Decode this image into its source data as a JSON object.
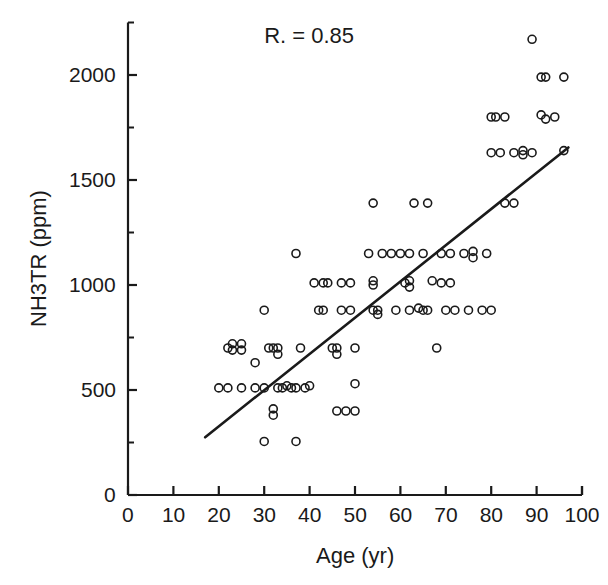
{
  "chart_data": {
    "type": "scatter",
    "title": "",
    "xlabel": "Age (yr)",
    "ylabel": "NH3TR (ppm)",
    "xlim": [
      0,
      100
    ],
    "ylim": [
      0,
      2250
    ],
    "xticks": [
      0,
      10,
      20,
      30,
      40,
      50,
      60,
      70,
      80,
      90,
      100
    ],
    "yticks": [
      0,
      500,
      1000,
      1500,
      2000
    ],
    "y_minor_ticks": [
      250,
      750,
      1250,
      1750,
      2250
    ],
    "xtick_labels": [
      "0",
      "10",
      "20",
      "30",
      "40",
      "50",
      "60",
      "70",
      "80",
      "90",
      "100"
    ],
    "ytick_labels": [
      "0",
      "500",
      "1000",
      "1500",
      "2000"
    ],
    "grid": false,
    "legend": null,
    "annotations": [
      {
        "text": "R. = 0.85",
        "x": 30,
        "y": 2180,
        "name": "correlation-annotation"
      }
    ],
    "marker": {
      "shape": "open-circle",
      "size": 8,
      "stroke": "#1a1a1a",
      "fill": "none"
    },
    "trendline": {
      "name": "regression-line",
      "x": [
        17,
        97
      ],
      "y": [
        275,
        1655
      ],
      "color": "#1a1a1a",
      "width": 2.6
    },
    "points": [
      {
        "x": 20,
        "y": 510
      },
      {
        "x": 22,
        "y": 700
      },
      {
        "x": 23,
        "y": 720
      },
      {
        "x": 23,
        "y": 690
      },
      {
        "x": 25,
        "y": 720
      },
      {
        "x": 25,
        "y": 690
      },
      {
        "x": 22,
        "y": 510
      },
      {
        "x": 25,
        "y": 510
      },
      {
        "x": 28,
        "y": 510
      },
      {
        "x": 30,
        "y": 510
      },
      {
        "x": 28,
        "y": 630
      },
      {
        "x": 30,
        "y": 880
      },
      {
        "x": 31,
        "y": 700
      },
      {
        "x": 32,
        "y": 700
      },
      {
        "x": 33,
        "y": 700
      },
      {
        "x": 33,
        "y": 670
      },
      {
        "x": 33,
        "y": 510
      },
      {
        "x": 34,
        "y": 510
      },
      {
        "x": 35,
        "y": 520
      },
      {
        "x": 36,
        "y": 510
      },
      {
        "x": 37,
        "y": 510
      },
      {
        "x": 32,
        "y": 410
      },
      {
        "x": 32,
        "y": 380
      },
      {
        "x": 30,
        "y": 255
      },
      {
        "x": 37,
        "y": 255
      },
      {
        "x": 38,
        "y": 700
      },
      {
        "x": 39,
        "y": 510
      },
      {
        "x": 40,
        "y": 520
      },
      {
        "x": 37,
        "y": 1150
      },
      {
        "x": 41,
        "y": 1010
      },
      {
        "x": 43,
        "y": 1010
      },
      {
        "x": 44,
        "y": 1010
      },
      {
        "x": 42,
        "y": 880
      },
      {
        "x": 43,
        "y": 880
      },
      {
        "x": 45,
        "y": 700
      },
      {
        "x": 46,
        "y": 700
      },
      {
        "x": 46,
        "y": 670
      },
      {
        "x": 46,
        "y": 400
      },
      {
        "x": 48,
        "y": 400
      },
      {
        "x": 50,
        "y": 400
      },
      {
        "x": 47,
        "y": 1010
      },
      {
        "x": 49,
        "y": 1010
      },
      {
        "x": 47,
        "y": 880
      },
      {
        "x": 49,
        "y": 880
      },
      {
        "x": 50,
        "y": 700
      },
      {
        "x": 50,
        "y": 530
      },
      {
        "x": 54,
        "y": 1390
      },
      {
        "x": 53,
        "y": 1150
      },
      {
        "x": 54,
        "y": 1020
      },
      {
        "x": 54,
        "y": 1000
      },
      {
        "x": 54,
        "y": 880
      },
      {
        "x": 55,
        "y": 880
      },
      {
        "x": 55,
        "y": 860
      },
      {
        "x": 56,
        "y": 1150
      },
      {
        "x": 58,
        "y": 1150
      },
      {
        "x": 59,
        "y": 880
      },
      {
        "x": 60,
        "y": 1150
      },
      {
        "x": 62,
        "y": 1150
      },
      {
        "x": 63,
        "y": 1390
      },
      {
        "x": 66,
        "y": 1390
      },
      {
        "x": 61,
        "y": 1010
      },
      {
        "x": 62,
        "y": 1020
      },
      {
        "x": 62,
        "y": 990
      },
      {
        "x": 62,
        "y": 880
      },
      {
        "x": 64,
        "y": 890
      },
      {
        "x": 65,
        "y": 880
      },
      {
        "x": 66,
        "y": 880
      },
      {
        "x": 65,
        "y": 1150
      },
      {
        "x": 67,
        "y": 1020
      },
      {
        "x": 69,
        "y": 1010
      },
      {
        "x": 71,
        "y": 1010
      },
      {
        "x": 68,
        "y": 700
      },
      {
        "x": 70,
        "y": 880
      },
      {
        "x": 72,
        "y": 880
      },
      {
        "x": 75,
        "y": 880
      },
      {
        "x": 69,
        "y": 1150
      },
      {
        "x": 71,
        "y": 1150
      },
      {
        "x": 74,
        "y": 1150
      },
      {
        "x": 76,
        "y": 1160
      },
      {
        "x": 76,
        "y": 1130
      },
      {
        "x": 79,
        "y": 1150
      },
      {
        "x": 78,
        "y": 880
      },
      {
        "x": 80,
        "y": 880
      },
      {
        "x": 80,
        "y": 1630
      },
      {
        "x": 82,
        "y": 1630
      },
      {
        "x": 80,
        "y": 1800
      },
      {
        "x": 81,
        "y": 1800
      },
      {
        "x": 83,
        "y": 1800
      },
      {
        "x": 83,
        "y": 1390
      },
      {
        "x": 85,
        "y": 1390
      },
      {
        "x": 85,
        "y": 1630
      },
      {
        "x": 87,
        "y": 1640
      },
      {
        "x": 87,
        "y": 1620
      },
      {
        "x": 89,
        "y": 1630
      },
      {
        "x": 89,
        "y": 2170
      },
      {
        "x": 91,
        "y": 1990
      },
      {
        "x": 92,
        "y": 1990
      },
      {
        "x": 96,
        "y": 1990
      },
      {
        "x": 91,
        "y": 1810
      },
      {
        "x": 92,
        "y": 1790
      },
      {
        "x": 94,
        "y": 1800
      },
      {
        "x": 96,
        "y": 1640
      }
    ]
  },
  "figure": {
    "axis_color": "#1a1a1a",
    "background": "#ffffff"
  }
}
